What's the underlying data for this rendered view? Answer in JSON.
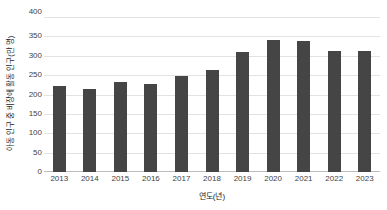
{
  "chart_data": {
    "type": "bar",
    "title": "",
    "subtitle": "",
    "categories": [
      "2013",
      "2014",
      "2015",
      "2016",
      "2017",
      "2018",
      "2019",
      "2020",
      "2021",
      "2022",
      "2023"
    ],
    "values": [
      223,
      213,
      232,
      226,
      247,
      263,
      309,
      341,
      337,
      313,
      312
    ],
    "series": [
      {
        "name": "",
        "values": [
          223,
          213,
          232,
          226,
          247,
          263,
          309,
          341,
          337,
          313,
          312
        ]
      }
    ],
    "xlabel": "연도(년)",
    "ylabel": "아동 인구 중 비장애 활동 인구(만 명)",
    "ylim": [
      0,
      400
    ],
    "ytick_labels": [
      "400",
      "350",
      "300",
      "250",
      "200",
      "150",
      "100",
      "50",
      "0"
    ],
    "ytick_values": [
      400,
      350,
      300,
      250,
      200,
      150,
      100,
      50,
      0
    ],
    "grid": true,
    "legend": false,
    "legend_position": "none",
    "bar_color": "#454545",
    "gridline_color": "#e2e2e2",
    "axis_color": "#bdbdbd",
    "background_color": "#ffffff"
  }
}
